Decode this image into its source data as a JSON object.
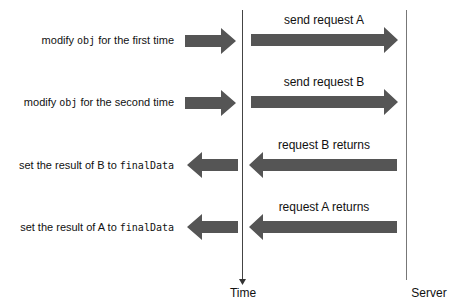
{
  "diagram": {
    "type": "sequence",
    "colors": {
      "arrow": "#555555",
      "line": "#444444",
      "text": "#111111"
    },
    "lanes": {
      "time_label": "Time",
      "server_label": "Server"
    },
    "rows": [
      {
        "client_pre": "modify ",
        "client_code": "obj",
        "client_post": " for the first time",
        "server_label": "send request A",
        "direction": "right"
      },
      {
        "client_pre": "modify ",
        "client_code": "obj",
        "client_post": " for the second time",
        "server_label": "send request B",
        "direction": "right"
      },
      {
        "client_pre": "set the result of B to ",
        "client_code": "finalData",
        "client_post": "",
        "server_label": "request B returns",
        "direction": "left"
      },
      {
        "client_pre": "set the result of A to ",
        "client_code": "finalData",
        "client_post": "",
        "server_label": "request A returns",
        "direction": "left"
      }
    ]
  }
}
